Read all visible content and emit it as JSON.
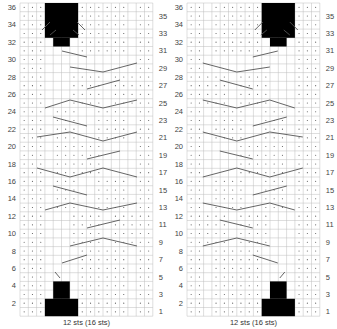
{
  "charts": [
    {
      "id": "left",
      "caption": "12 sts (16 sts)",
      "rows": 36,
      "cols": 16,
      "left_labels": [
        "2",
        "4",
        "6",
        "8",
        "10",
        "12",
        "14",
        "16",
        "18",
        "20",
        "22",
        "24",
        "26",
        "28",
        "30",
        "32",
        "34",
        "36"
      ],
      "right_labels": [
        "1",
        "3",
        "5",
        "7",
        "9",
        "11",
        "13",
        "15",
        "17",
        "19",
        "21",
        "23",
        "25",
        "27",
        "29",
        "31",
        "33",
        "35"
      ],
      "cable_side": "left"
    },
    {
      "id": "right",
      "caption": "12 sts (16 sts)",
      "rows": 36,
      "cols": 16,
      "left_labels": [
        "2",
        "4",
        "6",
        "8",
        "10",
        "12",
        "14",
        "16",
        "18",
        "20",
        "22",
        "24",
        "26",
        "28",
        "30",
        "32",
        "34",
        "36"
      ],
      "right_labels": [
        "1",
        "3",
        "5",
        "7",
        "9",
        "11",
        "13",
        "15",
        "17",
        "19",
        "21",
        "23",
        "25",
        "27",
        "29",
        "31",
        "33",
        "35"
      ],
      "cable_side": "right"
    }
  ],
  "colors": {
    "grid": "#bdbdbd",
    "line": "#555555",
    "fill": "#000000",
    "dot": "#555555"
  }
}
